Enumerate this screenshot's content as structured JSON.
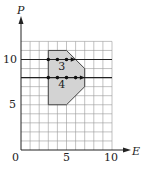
{
  "diagram": {
    "x_axis_label": "E",
    "y_axis_label": "P",
    "x_ticks": [
      "0",
      "5",
      "10"
    ],
    "y_ticks": [
      "5",
      "10"
    ],
    "grid": {
      "x_max": 10,
      "y_max": 12,
      "step": 1
    },
    "region": {
      "vertices": [
        [
          3,
          11
        ],
        [
          5,
          11
        ],
        [
          7,
          9
        ],
        [
          7,
          7
        ],
        [
          5,
          5
        ],
        [
          3,
          5
        ]
      ],
      "fill": "#d3d3d3"
    },
    "lines": [
      {
        "P": 10,
        "label": "3",
        "dots_E": [
          3,
          4,
          5
        ],
        "arrow_to_E": 5.8
      },
      {
        "P": 8,
        "label": "4",
        "dots_E": [
          3,
          4,
          5,
          6
        ],
        "arrow_to_E": 6.8
      }
    ]
  }
}
